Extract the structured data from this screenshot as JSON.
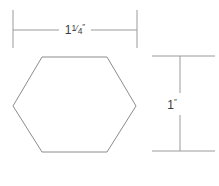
{
  "diagram": {
    "background_color": "#ffffff",
    "line_color": "#9a9a9a",
    "shape_line_color": "#8c8c8c",
    "text_color": "#3a3a3a"
  },
  "shape": {
    "name": "hexagon",
    "sides": 6,
    "orientation": "flat-top",
    "vertices": [
      {
        "x": 13,
        "y": 106
      },
      {
        "x": 42,
        "y": 57
      },
      {
        "x": 107,
        "y": 57
      },
      {
        "x": 136,
        "y": 106
      },
      {
        "x": 107,
        "y": 152
      },
      {
        "x": 42,
        "y": 152
      }
    ]
  },
  "dimensions": {
    "width": {
      "label_whole": "1",
      "label_fraction": "1/4",
      "label_numerator": "1",
      "label_denominator": "4",
      "unit_mark": "″",
      "full_label": "1¼″",
      "value": 1.25,
      "unit": "inch",
      "orientation": "horizontal",
      "position": "top",
      "line_y": 30,
      "start_x": 13,
      "end_x": 137,
      "ext_top_y": 10,
      "ext_bottom_y": 48,
      "gap_start_x": 59,
      "gap_end_x": 91,
      "text_x": 75,
      "text_y": 34
    },
    "height": {
      "label_whole": "1",
      "unit_mark": "″",
      "full_label": "1″",
      "value": 1,
      "unit": "inch",
      "orientation": "vertical",
      "position": "right",
      "line_x": 180,
      "start_y": 56,
      "end_y": 151,
      "ext_left_x": 152,
      "ext_right_x": 215,
      "gap_start_y": 93,
      "gap_end_y": 115,
      "text_x": 172,
      "text_y": 109
    }
  }
}
